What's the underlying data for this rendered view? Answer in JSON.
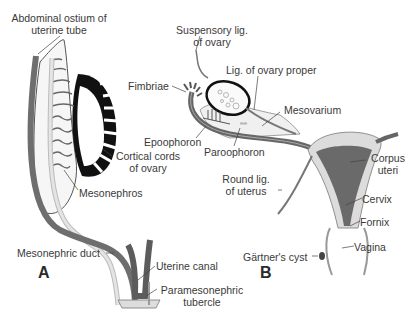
{
  "figure": {
    "panels": [
      {
        "id": "A",
        "label": "A"
      },
      {
        "id": "B",
        "label": "B"
      }
    ],
    "colors": {
      "background": "#ffffff",
      "duct_dark": "#6e6e6e",
      "duct_light": "#d9d9d9",
      "ovary_cords": "#111111",
      "uterus_dark": "#6a6a6a",
      "uterus_wall": "#dcdcdc",
      "outline": "#3a3a3a"
    }
  },
  "labels_a": {
    "abdominal_ostium": [
      "Abdominal ostium of",
      "uterine tube"
    ],
    "cortical_cords": [
      "Cortical cords",
      "of ovary"
    ],
    "mesonephros": "Mesonephros",
    "mesonephric_duct": "Mesonephric duct",
    "uterine_canal": "Uterine canal",
    "paramesonephric_tubercle": [
      "Paramesonephric",
      "tubercle"
    ]
  },
  "labels_b": {
    "suspensory_lig": [
      "Suspensory lig.",
      "of ovary"
    ],
    "lig_ovary_proper": "Lig. of ovary proper",
    "fimbriae": "Fimbriae",
    "mesovarium": "Mesovarium",
    "epoophoron": "Epoophoron",
    "paroophoron": "Paroophoron",
    "round_lig": [
      "Round lig.",
      "of uterus"
    ],
    "corpus_uteri": [
      "Corpus",
      "uteri"
    ],
    "cervix": "Cervix",
    "fornix": "Fornix",
    "vagina": "Vagina",
    "gartners_cyst": "Gärtner's cyst"
  }
}
